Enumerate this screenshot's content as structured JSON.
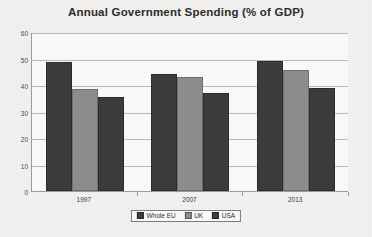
{
  "chart_data": {
    "type": "bar",
    "title": "Annual Government Spending (% of GDP)",
    "xlabel": "",
    "ylabel": "",
    "categories": [
      "1997",
      "2007",
      "2013"
    ],
    "series": [
      {
        "name": "Whole EU",
        "color": "#3b3b3b",
        "values": [
          48.5,
          44.0,
          49.0
        ]
      },
      {
        "name": "UK",
        "color": "#8d8d8d",
        "values": [
          38.5,
          43.0,
          45.5
        ]
      },
      {
        "name": "USA",
        "color": "#3b3b3b",
        "values": [
          35.5,
          37.0,
          39.0
        ]
      }
    ],
    "ylim": [
      0,
      60
    ],
    "yticks": [
      0,
      10,
      20,
      30,
      40,
      50,
      60
    ],
    "ytick_labels": [
      "0",
      "10",
      "20",
      "30",
      "40",
      "50",
      "60"
    ],
    "grid": true,
    "legend_position": "bottom-center"
  }
}
